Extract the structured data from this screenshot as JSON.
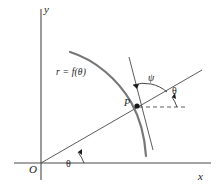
{
  "figure": {
    "background": "#ffffff",
    "width": 218,
    "height": 188
  },
  "axes": {
    "x_label": "x",
    "y_label": "y",
    "origin_label": "O",
    "color": "#4a4a4a",
    "x_axis": {
      "x1": 14,
      "y1": 163,
      "x2": 211,
      "y2": 163
    },
    "y_axis": {
      "x1": 41,
      "y1": 9,
      "x2": 41,
      "y2": 180
    }
  },
  "labels": {
    "curve": "r = f(θ)",
    "point": "P",
    "psi": "ψ",
    "theta_at_point": "θ",
    "theta_at_origin": "θ"
  },
  "elements": {
    "curve": {
      "name": "polar-curve",
      "color": "#777777",
      "stroke_width": 2.2,
      "path": "M 70 52 C 96 60 118 80 131 102 C 141 120 145 140 146 156"
    },
    "radial_line": {
      "name": "radial-line-from-origin",
      "color": "#4a4a4a",
      "stroke_width": 0.9,
      "x1": 41,
      "y1": 163,
      "x2": 202,
      "y2": 70
    },
    "tangent_line": {
      "name": "tangent-line-at-p",
      "color": "#4a4a4a",
      "stroke_width": 0.9,
      "x1": 129,
      "y1": 57,
      "x2": 153,
      "y2": 150
    },
    "dashed_ray": {
      "name": "horizontal-dashed-ray",
      "color": "#4a4a4a",
      "stroke_width": 0.9,
      "dash": "4,3",
      "x1": 139,
      "y1": 107,
      "x2": 186,
      "y2": 107
    },
    "point_marker": {
      "name": "point-p-marker",
      "color": "#1a1a1a",
      "cx": 137,
      "cy": 106,
      "r": 2.6
    },
    "psi_arc": {
      "name": "psi-angle-arc",
      "color": "#1a1a1a",
      "path": "M 166 91 A 34 34 0 0 0 131 86"
    },
    "theta_arc_point": {
      "name": "theta-angle-arc-at-point",
      "color": "#1a1a1a",
      "path": "M 178 107 A 40 40 0 0 0 173 96"
    },
    "theta_arc_origin": {
      "name": "theta-angle-arc-at-origin",
      "color": "#1a1a1a",
      "path": "M 85 163 A 44 44 0 0 0 79 152"
    }
  }
}
